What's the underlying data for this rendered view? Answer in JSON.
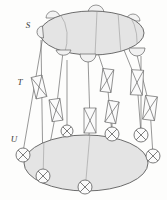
{
  "figure": {
    "background": "#fdfdfc",
    "stroke_color": "#5a5a5a",
    "fill_color": "#e6e6e6",
    "fill_color_dark": "#dcdcdc",
    "node_fill": "#f2f2f2",
    "labels": {
      "top": "S",
      "middle": "T",
      "bottom": "U"
    },
    "levels": [
      {
        "id": "S",
        "label": "S",
        "label_x": 28,
        "label_y": 28,
        "shape": "ellipse",
        "cx": 92,
        "cy": 33,
        "rx": 52,
        "ry": 22,
        "node_type": "semicircle",
        "node_count": 7
      },
      {
        "id": "T",
        "label": "T",
        "label_x": 20,
        "label_y": 82,
        "shape": "none",
        "node_type": "crossed-rectangle",
        "node_count": 7
      },
      {
        "id": "U",
        "label": "U",
        "label_x": 14,
        "label_y": 140,
        "shape": "ellipse",
        "cx": 86,
        "cy": 163,
        "rx": 62,
        "ry": 28,
        "node_type": "crossed-circle",
        "node_count": 7
      }
    ],
    "top_nodes": [
      {
        "cx": 53,
        "cy": 17,
        "r": 6,
        "orientation": "up"
      },
      {
        "cx": 96,
        "cy": 12,
        "r": 6,
        "orientation": "up"
      },
      {
        "cx": 133,
        "cy": 19,
        "r": 6,
        "orientation": "up"
      },
      {
        "cx": 63,
        "cy": 52,
        "r": 7,
        "orientation": "down"
      },
      {
        "cx": 88,
        "cy": 57,
        "r": 7,
        "orientation": "down"
      },
      {
        "cx": 137,
        "cy": 51,
        "r": 7,
        "orientation": "down"
      },
      {
        "cx": 43,
        "cy": 34,
        "r": 5,
        "orientation": "left"
      }
    ],
    "middle_nodes": [
      {
        "cx": 38,
        "cy": 86,
        "w": 10,
        "h": 22,
        "rot": -14
      },
      {
        "cx": 56,
        "cy": 109,
        "w": 10,
        "h": 22,
        "rot": -6
      },
      {
        "cx": 90,
        "cy": 119,
        "w": 11,
        "h": 24,
        "rot": 0
      },
      {
        "cx": 107,
        "cy": 79,
        "w": 10,
        "h": 22,
        "rot": 8
      },
      {
        "cx": 137,
        "cy": 82,
        "w": 11,
        "h": 24,
        "rot": 4
      },
      {
        "cx": 112,
        "cy": 113,
        "w": 10,
        "h": 22,
        "rot": 10
      },
      {
        "cx": 150,
        "cy": 108,
        "w": 11,
        "h": 23,
        "rot": 8
      }
    ],
    "bottom_nodes": [
      {
        "cx": 23,
        "cy": 155,
        "r": 7
      },
      {
        "cx": 43,
        "cy": 175,
        "r": 7
      },
      {
        "cx": 84,
        "cy": 185,
        "r": 7
      },
      {
        "cx": 112,
        "cy": 133,
        "r": 7
      },
      {
        "cx": 141,
        "cy": 133,
        "r": 7
      },
      {
        "cx": 152,
        "cy": 155,
        "r": 7
      },
      {
        "cx": 67,
        "cy": 131,
        "r": 6
      }
    ],
    "connectors": [
      {
        "x1": 43,
        "y1": 36,
        "x2": 23,
        "y2": 150
      },
      {
        "x1": 38,
        "y1": 86,
        "x2": 43,
        "y2": 170
      },
      {
        "x1": 63,
        "y1": 58,
        "x2": 56,
        "y2": 104
      },
      {
        "x1": 56,
        "y1": 115,
        "x2": 43,
        "y2": 172
      },
      {
        "x1": 88,
        "y1": 64,
        "x2": 90,
        "y2": 108
      },
      {
        "x1": 90,
        "y1": 131,
        "x2": 84,
        "y2": 180
      },
      {
        "x1": 107,
        "y1": 68,
        "x2": 112,
        "y2": 103
      },
      {
        "x1": 112,
        "y1": 124,
        "x2": 112,
        "y2": 129
      },
      {
        "x1": 137,
        "y1": 58,
        "x2": 137,
        "y2": 71
      },
      {
        "x1": 137,
        "y1": 94,
        "x2": 141,
        "y2": 129
      },
      {
        "x1": 150,
        "y1": 120,
        "x2": 152,
        "y2": 150
      },
      {
        "x1": 137,
        "y1": 58,
        "x2": 150,
        "y2": 97
      }
    ]
  }
}
